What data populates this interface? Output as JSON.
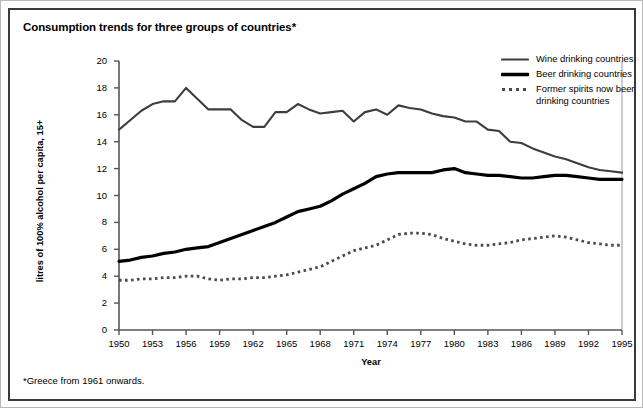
{
  "figure": {
    "title": "Consumption trends for three groups of countries*",
    "footnote": "*Greece from 1961 onwards."
  },
  "legend": {
    "items": [
      {
        "label": "Wine drinking countries",
        "style": "solid-thin",
        "color": "#3d3d3d",
        "icon": "line-swatch-icon"
      },
      {
        "label": "Beer drinking countries",
        "style": "solid-thick",
        "color": "#000000",
        "icon": "line-swatch-icon"
      },
      {
        "label": "Former spirits now beer drinking countries",
        "style": "dotted",
        "color": "#4a4a4a",
        "icon": "dotted-line-swatch-icon"
      }
    ]
  },
  "chart_data": {
    "type": "line",
    "title": "Consumption trends for three groups of countries*",
    "xlabel": "Year",
    "ylabel": "litres of 100% alcohol per capita, 15+",
    "xlim": [
      1950,
      1995
    ],
    "ylim": [
      0,
      20
    ],
    "ytick_step": 2,
    "xtick_step": 3,
    "grid": false,
    "legend_position": "top-right",
    "yticks": [
      "0",
      "2",
      "4",
      "6",
      "8",
      "10",
      "12",
      "14",
      "16",
      "18",
      "20"
    ],
    "xticks": [
      "1950",
      "1953",
      "1956",
      "1959",
      "1962",
      "1965",
      "1968",
      "1971",
      "1974",
      "1977",
      "1980",
      "1983",
      "1986",
      "1989",
      "1992",
      "1995"
    ],
    "x": [
      1950,
      1951,
      1952,
      1953,
      1954,
      1955,
      1956,
      1957,
      1958,
      1959,
      1960,
      1961,
      1962,
      1963,
      1964,
      1965,
      1966,
      1967,
      1968,
      1969,
      1970,
      1971,
      1972,
      1973,
      1974,
      1975,
      1976,
      1977,
      1978,
      1979,
      1980,
      1981,
      1982,
      1983,
      1984,
      1985,
      1986,
      1987,
      1988,
      1989,
      1990,
      1991,
      1992,
      1993,
      1994,
      1995
    ],
    "series": [
      {
        "name": "Wine drinking countries",
        "color": "#3d3d3d",
        "style": "solid-thin",
        "values": [
          14.9,
          15.6,
          16.3,
          16.8,
          17.0,
          17.0,
          18.0,
          17.2,
          16.4,
          16.4,
          16.4,
          15.6,
          15.1,
          15.1,
          16.2,
          16.2,
          16.8,
          16.4,
          16.1,
          16.2,
          16.3,
          15.5,
          16.2,
          16.4,
          16.0,
          16.7,
          16.5,
          16.4,
          16.1,
          15.9,
          15.8,
          15.5,
          15.5,
          14.9,
          14.8,
          14.0,
          13.9,
          13.5,
          13.2,
          12.9,
          12.7,
          12.4,
          12.1,
          11.9,
          11.8,
          11.7
        ]
      },
      {
        "name": "Beer drinking countries",
        "color": "#000000",
        "style": "solid-thick",
        "values": [
          5.1,
          5.2,
          5.4,
          5.5,
          5.7,
          5.8,
          6.0,
          6.1,
          6.2,
          6.5,
          6.8,
          7.1,
          7.4,
          7.7,
          8.0,
          8.4,
          8.8,
          9.0,
          9.2,
          9.6,
          10.1,
          10.5,
          10.9,
          11.4,
          11.6,
          11.7,
          11.7,
          11.7,
          11.7,
          11.9,
          12.0,
          11.7,
          11.6,
          11.5,
          11.5,
          11.4,
          11.3,
          11.3,
          11.4,
          11.5,
          11.5,
          11.4,
          11.3,
          11.2,
          11.2,
          11.2
        ]
      },
      {
        "name": "Former spirits now beer drinking countries",
        "color": "#4a4a4a",
        "style": "dotted",
        "values": [
          3.7,
          3.7,
          3.8,
          3.8,
          3.9,
          3.9,
          4.0,
          4.0,
          3.8,
          3.7,
          3.8,
          3.8,
          3.9,
          3.9,
          4.0,
          4.1,
          4.3,
          4.5,
          4.7,
          5.1,
          5.5,
          5.9,
          6.1,
          6.3,
          6.7,
          7.1,
          7.2,
          7.2,
          7.1,
          6.8,
          6.6,
          6.4,
          6.3,
          6.3,
          6.4,
          6.5,
          6.7,
          6.8,
          6.9,
          7.0,
          6.9,
          6.7,
          6.5,
          6.4,
          6.3,
          6.3
        ]
      }
    ]
  }
}
